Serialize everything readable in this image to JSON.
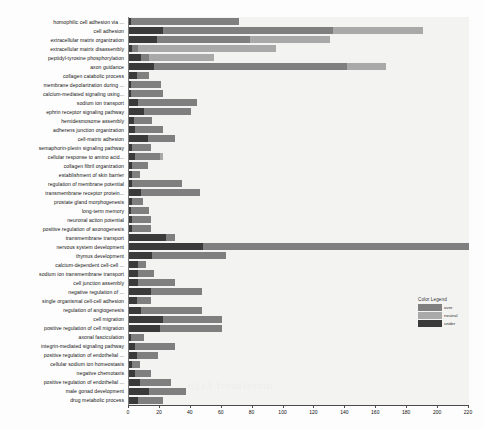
{
  "chart_data": {
    "type": "bar",
    "orientation": "horizontal",
    "stacked": true,
    "title": "",
    "xlabel": "",
    "ylabel": "",
    "xlim": [
      0,
      220
    ],
    "grid": false,
    "xticks": [
      0,
      20,
      40,
      60,
      80,
      100,
      120,
      140,
      160,
      180,
      200,
      220
    ],
    "legend": {
      "title": "Color Legend",
      "position": "right-middle",
      "entries": [
        {
          "label": "over",
          "color": "#7f7f7f"
        },
        {
          "label": "neutral",
          "color": "#a9a9a9"
        },
        {
          "label": "under",
          "color": "#3a3a3a"
        }
      ]
    },
    "series": [
      {
        "name": "over",
        "color": "#7f7f7f"
      },
      {
        "name": "neutral",
        "color": "#a9a9a9"
      },
      {
        "name": "under",
        "color": "#3a3a3a"
      }
    ],
    "categories": [
      "homophilic cell adhesion via ...",
      "cell adhesion",
      "extracellular matrix organization",
      "extracellular matrix disassembly",
      "peptidyl-tyrosine phosphorylation",
      "axon guidance",
      "collagen catabolic process",
      "membrane depolarization during ...",
      "calcium-mediated signaling using...",
      "sodium ion transport",
      "ephrin receptor signaling pathway",
      "hemidesmosome assembly",
      "adherens junction organization",
      "cell-matrix adhesion",
      "semaphorin-plexin signaling pathway",
      "cellular response to amino acid...",
      "collagen fibril organization",
      "establishment of skin barrier",
      "regulation of membrane potential",
      "transmembrane receptor protein...",
      "prostate gland morphogenesis",
      "long-term memory",
      "neuronal action potential",
      "positive regulation of axonogenesis",
      "transmembrane transport",
      "nervous system development",
      "thymus development",
      "calcium-dependent cell-cell ...",
      "sodium ion transmembrane transport",
      "cell junction assembly",
      "negative regulation of ...",
      "single organismal cell-cell adhesion",
      "regulation of angiogenesis",
      "cell migration",
      "positive regulation of cell migration",
      "axonal fasciculation",
      "integrin-mediated signaling pathway",
      "positive regulation of endothelial ...",
      "cellular sodium ion homeostasis",
      "negative chemotaxis",
      "positive regulation of endothelial ...",
      "male gonad development",
      "drug metabolic process"
    ],
    "rows": [
      {
        "category": "homophilic cell adhesion via ...",
        "over": 70,
        "neutral": 0,
        "under": 1,
        "total": 71
      },
      {
        "category": "cell adhesion",
        "over": 110,
        "neutral": 58,
        "under": 22,
        "total": 190
      },
      {
        "category": "extracellular matrix organization",
        "over": 60,
        "neutral": 52,
        "under": 18,
        "total": 130
      },
      {
        "category": "extracellular matrix disassembly",
        "over": 4,
        "neutral": 89,
        "under": 2,
        "total": 95
      },
      {
        "category": "peptidyl-tyrosine phosphorylation",
        "over": 5,
        "neutral": 42,
        "under": 8,
        "total": 55
      },
      {
        "category": "axon guidance",
        "over": 125,
        "neutral": 25,
        "under": 16,
        "total": 166
      },
      {
        "category": "collagen catabolic process",
        "over": 8,
        "neutral": 0,
        "under": 5,
        "total": 13
      },
      {
        "category": "membrane depolarization during ...",
        "over": 20,
        "neutral": 0,
        "under": 1,
        "total": 21
      },
      {
        "category": "calcium-mediated signaling using...",
        "over": 21,
        "neutral": 0,
        "under": 1,
        "total": 22
      },
      {
        "category": "sodium ion transport",
        "over": 38,
        "neutral": 0,
        "under": 6,
        "total": 44
      },
      {
        "category": "ephrin receptor signaling pathway",
        "over": 30,
        "neutral": 0,
        "under": 10,
        "total": 40
      },
      {
        "category": "hemidesmosome assembly",
        "over": 12,
        "neutral": 0,
        "under": 3,
        "total": 15
      },
      {
        "category": "adherens junction organization",
        "over": 18,
        "neutral": 0,
        "under": 4,
        "total": 22
      },
      {
        "category": "cell-matrix adhesion",
        "over": 18,
        "neutral": 0,
        "under": 12,
        "total": 30
      },
      {
        "category": "semaphorin-plexin signaling pathway",
        "over": 12,
        "neutral": 0,
        "under": 2,
        "total": 14
      },
      {
        "category": "cellular response to amino acid...",
        "over": 16,
        "neutral": 2,
        "under": 4,
        "total": 22
      },
      {
        "category": "collagen fibril organization",
        "over": 10,
        "neutral": 0,
        "under": 2,
        "total": 12
      },
      {
        "category": "establishment of skin barrier",
        "over": 5,
        "neutral": 0,
        "under": 2,
        "total": 7
      },
      {
        "category": "regulation of membrane potential",
        "over": 32,
        "neutral": 0,
        "under": 2,
        "total": 34
      },
      {
        "category": "transmembrane receptor protein...",
        "over": 38,
        "neutral": 0,
        "under": 8,
        "total": 46
      },
      {
        "category": "prostate gland morphogenesis",
        "over": 7,
        "neutral": 0,
        "under": 2,
        "total": 9
      },
      {
        "category": "long-term memory",
        "over": 12,
        "neutral": 0,
        "under": 1,
        "total": 13
      },
      {
        "category": "neuronal action potential",
        "over": 12,
        "neutral": 0,
        "under": 2,
        "total": 14
      },
      {
        "category": "positive regulation of axonogenesis",
        "over": 12,
        "neutral": 0,
        "under": 2,
        "total": 14
      },
      {
        "category": "transmembrane transport",
        "over": 6,
        "neutral": 0,
        "under": 24,
        "total": 30
      },
      {
        "category": "nervous system development",
        "over": 172,
        "neutral": 0,
        "under": 48,
        "total": 220
      },
      {
        "category": "thymus development",
        "over": 48,
        "neutral": 0,
        "under": 15,
        "total": 63
      },
      {
        "category": "calcium-dependent cell-cell ...",
        "over": 5,
        "neutral": 0,
        "under": 6,
        "total": 11
      },
      {
        "category": "sodium ion transmembrane transport",
        "over": 10,
        "neutral": 0,
        "under": 6,
        "total": 16
      },
      {
        "category": "cell junction assembly",
        "over": 24,
        "neutral": 0,
        "under": 6,
        "total": 30
      },
      {
        "category": "negative regulation of ...",
        "over": 33,
        "neutral": 0,
        "under": 14,
        "total": 47
      },
      {
        "category": "single organismal cell-cell adhesion",
        "over": 9,
        "neutral": 0,
        "under": 5,
        "total": 14
      },
      {
        "category": "regulation of angiogenesis",
        "over": 39,
        "neutral": 0,
        "under": 8,
        "total": 47
      },
      {
        "category": "cell migration",
        "over": 38,
        "neutral": 0,
        "under": 22,
        "total": 60
      },
      {
        "category": "positive regulation of cell migration",
        "over": 40,
        "neutral": 0,
        "under": 20,
        "total": 60
      },
      {
        "category": "axonal fasciculation",
        "over": 9,
        "neutral": 0,
        "under": 1,
        "total": 10
      },
      {
        "category": "integrin-mediated signaling pathway",
        "over": 26,
        "neutral": 0,
        "under": 4,
        "total": 30
      },
      {
        "category": "positive regulation of endothelial ...",
        "over": 14,
        "neutral": 0,
        "under": 5,
        "total": 19
      },
      {
        "category": "cellular sodium ion homeostasis",
        "over": 5,
        "neutral": 0,
        "under": 2,
        "total": 7
      },
      {
        "category": "negative chemotaxis",
        "over": 10,
        "neutral": 0,
        "under": 4,
        "total": 14
      },
      {
        "category": "positive regulation of endothelial ...",
        "over": 20,
        "neutral": 0,
        "under": 7,
        "total": 27
      },
      {
        "category": "male gonad development",
        "over": 24,
        "neutral": 0,
        "under": 13,
        "total": 37
      },
      {
        "category": "drug metabolic process",
        "over": 16,
        "neutral": 0,
        "under": 6,
        "total": 22
      }
    ]
  },
  "watermark": {
    "text": "dgs3  frontiersin"
  }
}
